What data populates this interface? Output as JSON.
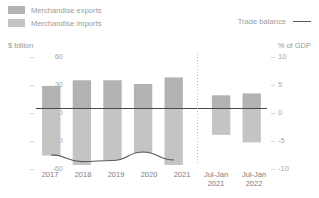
{
  "legend": {
    "items": [
      {
        "label": "Merchandise exports",
        "color": "#b2b2b2",
        "icon": "square-swatch-icon"
      },
      {
        "label": "Merchandise imports",
        "color": "#c4c4c4",
        "icon": "square-swatch-icon"
      }
    ],
    "line_item": {
      "label": "Trade balance",
      "color": "#5b5b5b",
      "icon": "line-swatch-icon"
    }
  },
  "axes": {
    "left_title": "$ billion",
    "right_title": "% of GDP",
    "left_ticks": [
      "60",
      "30",
      "0",
      "-30",
      "-60"
    ],
    "right_ticks": [
      "10",
      "5",
      "0",
      "-5",
      "-10"
    ]
  },
  "chart_data": {
    "type": "bar",
    "title": "",
    "subtitle": "",
    "xlabel": "",
    "ylabel": "$ billion",
    "y2label": "% of GDP",
    "ylim": [
      -60,
      60
    ],
    "y2lim": [
      -10,
      10
    ],
    "grid": false,
    "legend_position": "top",
    "categories": [
      "2017",
      "2018",
      "2019",
      "2020",
      "2021",
      "Jul-Jan\n2021",
      "Jul-Jan\n2022"
    ],
    "series": [
      {
        "name": "Merchandise exports",
        "axis": "left",
        "color": "#b2b2b2",
        "values": [
          24,
          30,
          30,
          26,
          33,
          14,
          16
        ]
      },
      {
        "name": "Merchandise imports",
        "axis": "left",
        "color": "#c4c4c4",
        "values": [
          -50,
          -60,
          -55,
          -47,
          -60,
          -28,
          -36
        ]
      },
      {
        "name": "Trade balance",
        "axis": "right",
        "type": "line",
        "color": "#5b5b5b",
        "values": [
          -8.2,
          -9.4,
          -9.2,
          -7.7,
          -9.1,
          null,
          null
        ]
      }
    ],
    "annotations": [
      {
        "type": "vertical-divider",
        "style": "dotted",
        "after_category": "2021"
      },
      {
        "type": "zero-line",
        "axis": "left",
        "value": 0
      }
    ]
  }
}
